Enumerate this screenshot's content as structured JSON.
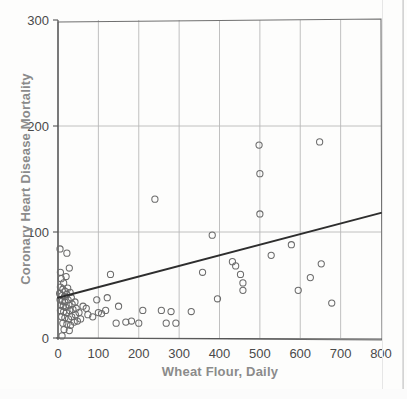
{
  "chart_data": {
    "type": "scatter",
    "title": "",
    "xlabel": "Wheat Flour, Daily",
    "ylabel": "Coronary Heart Disease Mortality",
    "xlim": [
      0,
      800
    ],
    "ylim": [
      0,
      300
    ],
    "xticks": [
      0,
      100,
      200,
      300,
      400,
      500,
      600,
      700,
      800
    ],
    "yticks": [
      0,
      100,
      200,
      300
    ],
    "xtick_labels": [
      "0",
      "100",
      "200",
      "300",
      "400",
      "500",
      "600",
      "700",
      "800"
    ],
    "ytick_labels": [
      "0",
      "100",
      "200",
      "300"
    ],
    "grid": true,
    "grid_color": "#b9b9b9",
    "legend": "none",
    "marker": "open-circle",
    "marker_color": "#6b6b6b",
    "trendline": {
      "type": "linear",
      "x": [
        0,
        800
      ],
      "y": [
        38,
        118
      ],
      "color": "#2e2e2e"
    },
    "points": [
      {
        "x": 5,
        "y": 84
      },
      {
        "x": 22,
        "y": 80
      },
      {
        "x": 6,
        "y": 62
      },
      {
        "x": 28,
        "y": 66
      },
      {
        "x": 8,
        "y": 56
      },
      {
        "x": 14,
        "y": 52
      },
      {
        "x": 20,
        "y": 58
      },
      {
        "x": 6,
        "y": 48
      },
      {
        "x": 12,
        "y": 46
      },
      {
        "x": 18,
        "y": 44
      },
      {
        "x": 24,
        "y": 47
      },
      {
        "x": 4,
        "y": 42
      },
      {
        "x": 10,
        "y": 40
      },
      {
        "x": 16,
        "y": 39
      },
      {
        "x": 22,
        "y": 41
      },
      {
        "x": 30,
        "y": 43
      },
      {
        "x": 5,
        "y": 36
      },
      {
        "x": 11,
        "y": 35
      },
      {
        "x": 17,
        "y": 34
      },
      {
        "x": 25,
        "y": 36
      },
      {
        "x": 33,
        "y": 38
      },
      {
        "x": 7,
        "y": 31
      },
      {
        "x": 13,
        "y": 30
      },
      {
        "x": 19,
        "y": 29
      },
      {
        "x": 27,
        "y": 31
      },
      {
        "x": 35,
        "y": 32
      },
      {
        "x": 42,
        "y": 34
      },
      {
        "x": 6,
        "y": 26
      },
      {
        "x": 14,
        "y": 25
      },
      {
        "x": 21,
        "y": 24
      },
      {
        "x": 29,
        "y": 26
      },
      {
        "x": 37,
        "y": 27
      },
      {
        "x": 45,
        "y": 28
      },
      {
        "x": 9,
        "y": 20
      },
      {
        "x": 17,
        "y": 19
      },
      {
        "x": 26,
        "y": 18
      },
      {
        "x": 34,
        "y": 20
      },
      {
        "x": 43,
        "y": 22
      },
      {
        "x": 12,
        "y": 14
      },
      {
        "x": 22,
        "y": 13
      },
      {
        "x": 31,
        "y": 12
      },
      {
        "x": 40,
        "y": 15
      },
      {
        "x": 48,
        "y": 16
      },
      {
        "x": 15,
        "y": 8
      },
      {
        "x": 28,
        "y": 7
      },
      {
        "x": 10,
        "y": 2
      },
      {
        "x": 52,
        "y": 24
      },
      {
        "x": 56,
        "y": 18
      },
      {
        "x": 62,
        "y": 30
      },
      {
        "x": 70,
        "y": 28
      },
      {
        "x": 74,
        "y": 22
      },
      {
        "x": 86,
        "y": 20
      },
      {
        "x": 96,
        "y": 36
      },
      {
        "x": 100,
        "y": 24
      },
      {
        "x": 108,
        "y": 23
      },
      {
        "x": 118,
        "y": 26
      },
      {
        "x": 122,
        "y": 38
      },
      {
        "x": 130,
        "y": 60
      },
      {
        "x": 144,
        "y": 14
      },
      {
        "x": 150,
        "y": 30
      },
      {
        "x": 168,
        "y": 15
      },
      {
        "x": 182,
        "y": 16
      },
      {
        "x": 200,
        "y": 14
      },
      {
        "x": 210,
        "y": 26
      },
      {
        "x": 240,
        "y": 131
      },
      {
        "x": 256,
        "y": 26
      },
      {
        "x": 268,
        "y": 14
      },
      {
        "x": 280,
        "y": 25
      },
      {
        "x": 292,
        "y": 14
      },
      {
        "x": 330,
        "y": 25
      },
      {
        "x": 358,
        "y": 62
      },
      {
        "x": 382,
        "y": 97
      },
      {
        "x": 395,
        "y": 37
      },
      {
        "x": 432,
        "y": 72
      },
      {
        "x": 440,
        "y": 68
      },
      {
        "x": 452,
        "y": 60
      },
      {
        "x": 458,
        "y": 52
      },
      {
        "x": 458,
        "y": 45
      },
      {
        "x": 498,
        "y": 182
      },
      {
        "x": 500,
        "y": 155
      },
      {
        "x": 500,
        "y": 117
      },
      {
        "x": 528,
        "y": 78
      },
      {
        "x": 578,
        "y": 88
      },
      {
        "x": 595,
        "y": 45
      },
      {
        "x": 625,
        "y": 57
      },
      {
        "x": 648,
        "y": 185
      },
      {
        "x": 652,
        "y": 70
      },
      {
        "x": 678,
        "y": 33
      }
    ]
  }
}
